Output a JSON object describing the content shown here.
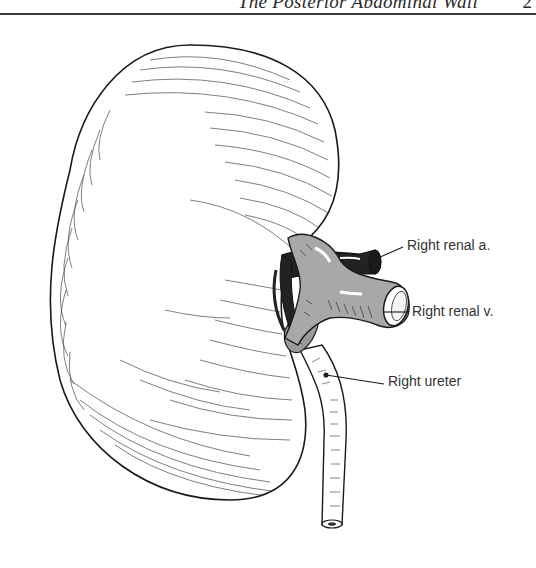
{
  "page": {
    "running_head": "The Posterior Abdominal Wall",
    "page_number": "2"
  },
  "figure": {
    "labels": [
      {
        "text": "Right renal a.",
        "x": 407,
        "y": 237
      },
      {
        "text": "Right renal v.",
        "x": 412,
        "y": 303
      },
      {
        "text": "Right ureter",
        "x": 388,
        "y": 373
      }
    ]
  },
  "colors": {
    "ink": "#1a1a1a",
    "vein_fill": "#a8a8a8",
    "artery_fill": "#222222",
    "paper": "#ffffff"
  }
}
